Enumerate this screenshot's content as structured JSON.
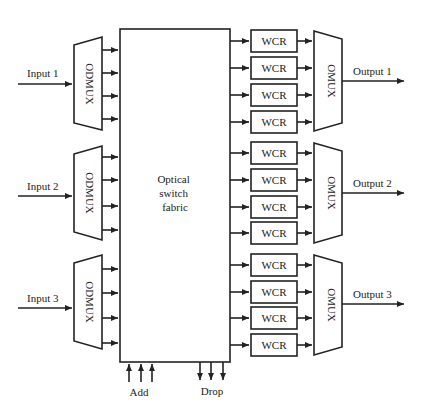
{
  "diagram": {
    "switch_fabric": {
      "label_lines": [
        "Optical",
        "switch",
        "fabric"
      ]
    },
    "inputs": [
      {
        "label": "Input 1",
        "demux_label": "ODMUX"
      },
      {
        "label": "Input 2",
        "demux_label": "ODMUX"
      },
      {
        "label": "Input 3",
        "demux_label": "ODMUX"
      }
    ],
    "outputs": [
      {
        "label": "Output 1",
        "mux_label": "OMUX",
        "wcr": [
          "WCR",
          "WCR",
          "WCR",
          "WCR"
        ]
      },
      {
        "label": "Output 2",
        "mux_label": "OMUX",
        "wcr": [
          "WCR",
          "WCR",
          "WCR",
          "WCR"
        ]
      },
      {
        "label": "Output 3",
        "mux_label": "OMUX",
        "wcr": [
          "WCR",
          "WCR",
          "WCR",
          "WCR"
        ]
      }
    ],
    "add_label": "Add",
    "drop_label": "Drop"
  }
}
